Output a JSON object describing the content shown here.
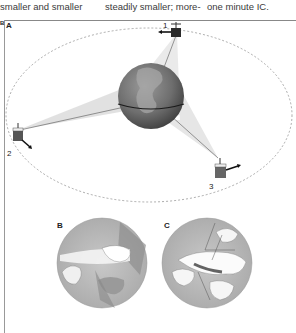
{
  "text_columns": [
    {
      "text": "smaller and smaller"
    },
    {
      "text": "steadily smaller; more-"
    },
    {
      "text": "one minute IC."
    }
  ],
  "figure": {
    "margin_label": "B",
    "panel_a_label": "A",
    "panel_b_label": "B",
    "panel_c_label": "C",
    "satellites": [
      {
        "number": "1"
      },
      {
        "number": "2"
      },
      {
        "number": "3"
      }
    ]
  }
}
